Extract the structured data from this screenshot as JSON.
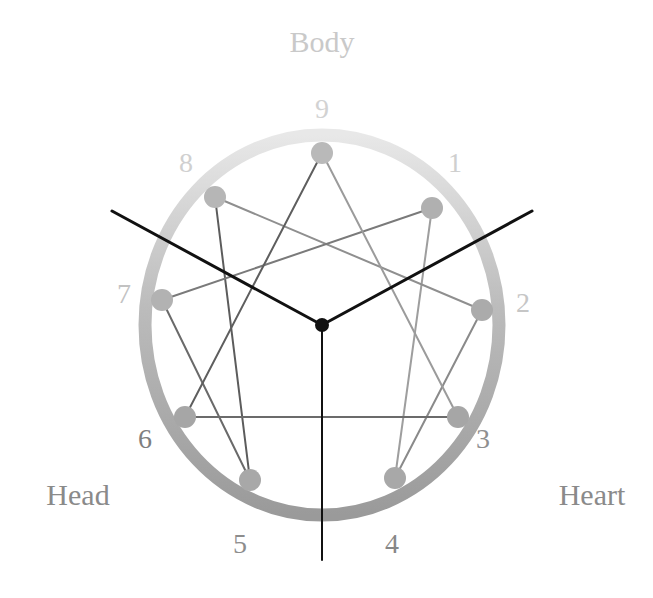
{
  "diagram": {
    "type": "enneagram",
    "title_visible": false,
    "background": "#ffffff",
    "center_dot_color": "#111111",
    "group_labels": [
      {
        "id": "body",
        "text": "Body",
        "color": "#c9c9c9",
        "x": 322,
        "y": 52,
        "anchor": "middle"
      },
      {
        "id": "head",
        "text": "Head",
        "color": "#8a8a8a",
        "x": 78,
        "y": 505,
        "anchor": "middle"
      },
      {
        "id": "heart",
        "text": "Heart",
        "color": "#8a8a8a",
        "x": 592,
        "y": 505,
        "anchor": "middle"
      }
    ],
    "points": [
      {
        "num": "9",
        "angle_deg": 90,
        "node_x": 322,
        "node_y": 153,
        "node_color": "#b9b9b9",
        "label_x": 322,
        "label_y": 118,
        "label_color": "#d2d2d2"
      },
      {
        "num": "1",
        "angle_deg": 50,
        "node_x": 432,
        "node_y": 208,
        "node_color": "#b0b0b0",
        "label_x": 455,
        "label_y": 172,
        "label_color": "#cfcfcf"
      },
      {
        "num": "2",
        "angle_deg": 10,
        "node_x": 482,
        "node_y": 310,
        "node_color": "#ababab",
        "label_x": 523,
        "label_y": 312,
        "label_color": "#c6c6c6"
      },
      {
        "num": "3",
        "angle_deg": 330,
        "node_x": 458,
        "node_y": 417,
        "node_color": "#a6a6a6",
        "label_x": 483,
        "label_y": 448,
        "label_color": "#8f8f8f"
      },
      {
        "num": "4",
        "angle_deg": 290,
        "node_x": 395,
        "node_y": 478,
        "node_color": "#a8a8a8",
        "label_x": 392,
        "label_y": 553,
        "label_color": "#878787"
      },
      {
        "num": "5",
        "angle_deg": 250,
        "node_x": 250,
        "node_y": 480,
        "node_color": "#a8a8a8",
        "label_x": 240,
        "label_y": 553,
        "label_color": "#8d8d8d"
      },
      {
        "num": "6",
        "angle_deg": 210,
        "node_x": 185,
        "node_y": 417,
        "node_color": "#a6a6a6",
        "label_x": 145,
        "label_y": 448,
        "label_color": "#7f7f7f"
      },
      {
        "num": "7",
        "angle_deg": 170,
        "node_x": 162,
        "node_y": 300,
        "node_color": "#b2b2b2",
        "label_x": 124,
        "label_y": 303,
        "label_color": "#c2c2c2"
      },
      {
        "num": "8",
        "angle_deg": 130,
        "node_x": 215,
        "node_y": 197,
        "node_color": "#b6b6b6",
        "label_x": 186,
        "label_y": 172,
        "label_color": "#d0d0d0"
      }
    ],
    "ring": {
      "center_x": 322,
      "center_y": 325,
      "radius_x": 177,
      "radius_y": 190,
      "stroke_width": 13,
      "gradient_top_color": "#e8e8e8",
      "gradient_mid_color": "#bcbcbc",
      "gradient_bottom_color": "#9a9a9a"
    },
    "triangle_edges": [
      {
        "from": "9",
        "to": "3",
        "color": "#9b9b9b",
        "width": 2
      },
      {
        "from": "3",
        "to": "6",
        "color": "#6b6b6b",
        "width": 2
      },
      {
        "from": "6",
        "to": "9",
        "color": "#5e5e5e",
        "width": 2
      }
    ],
    "hexad_edges": [
      {
        "from": "1",
        "to": "4",
        "color": "#9e9e9e",
        "width": 2
      },
      {
        "from": "4",
        "to": "2",
        "color": "#8a8a8a",
        "width": 2
      },
      {
        "from": "2",
        "to": "8",
        "color": "#8f8f8f",
        "width": 2
      },
      {
        "from": "8",
        "to": "5",
        "color": "#5c5c5c",
        "width": 2
      },
      {
        "from": "5",
        "to": "7",
        "color": "#6a6a6a",
        "width": 2
      },
      {
        "from": "7",
        "to": "1",
        "color": "#7a7a7a",
        "width": 2
      }
    ],
    "center_rays": [
      {
        "id": "ray-upper-left",
        "to_x": 112,
        "to_y": 211,
        "color": "#111111",
        "width": 3,
        "extends_beyond_ring": true
      },
      {
        "id": "ray-upper-right",
        "to_x": 532,
        "to_y": 211,
        "color": "#111111",
        "width": 3,
        "extends_beyond_ring": true
      },
      {
        "id": "ray-down",
        "to_x": 322,
        "to_y": 560,
        "color": "#111111",
        "width": 2,
        "extends_beyond_ring": true
      }
    ],
    "node_radius": 11,
    "center_dot_radius": 7
  },
  "chart_data": {
    "type": "diagram",
    "categories": [
      "1",
      "2",
      "3",
      "4",
      "5",
      "6",
      "7",
      "8",
      "9"
    ],
    "centers": {
      "Body": [
        "8",
        "9",
        "1"
      ],
      "Heart": [
        "2",
        "3",
        "4"
      ],
      "Head": [
        "5",
        "6",
        "7"
      ]
    },
    "inner_triangle": [
      "9",
      "3",
      "6"
    ],
    "hexad_sequence": [
      "1",
      "4",
      "2",
      "8",
      "5",
      "7",
      "1"
    ],
    "legend": [
      "Body",
      "Head",
      "Heart"
    ]
  }
}
